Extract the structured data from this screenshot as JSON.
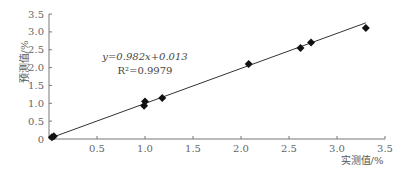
{
  "chart_data": {
    "type": "scatter",
    "title": "",
    "xlabel": "实测值/%",
    "ylabel": "预测值/%",
    "xlim": [
      0,
      3.5
    ],
    "ylim": [
      0,
      3.5
    ],
    "x_ticks": [
      "0.5",
      "1.0",
      "1.5",
      "2.0",
      "2.5",
      "3.0",
      "3.5"
    ],
    "y_ticks": [
      "0",
      "0.5",
      "1.0",
      "1.5",
      "2.0",
      "2.5",
      "3.0",
      "3.5"
    ],
    "grid": false,
    "legend": null,
    "series": [
      {
        "name": "data",
        "marker": "diamond",
        "x": [
          0.03,
          0.05,
          0.99,
          1.0,
          1.18,
          2.08,
          2.62,
          2.73,
          3.3
        ],
        "y": [
          0.05,
          0.08,
          0.93,
          1.05,
          1.15,
          2.1,
          2.55,
          2.7,
          3.11
        ]
      }
    ],
    "trendline": {
      "slope": 0.982,
      "intercept": 0.013,
      "x_range": [
        0,
        3.3
      ]
    },
    "annotations": {
      "equation": "y=0.982x+0.013",
      "r2": "R²=0.9979"
    }
  }
}
